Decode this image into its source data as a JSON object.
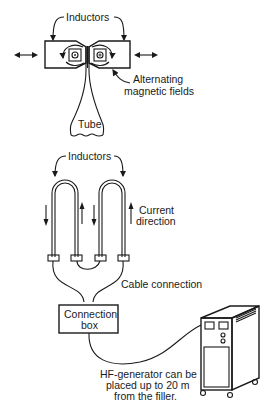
{
  "diagram": {
    "top": {
      "inductors_label": "Inductors",
      "magnetic_label_line1": "Alternating",
      "magnetic_label_line2": "magnetic fields",
      "tube_label": "Tube"
    },
    "bottom": {
      "inductors_label": "Inductors",
      "current_label_line1": "Current",
      "current_label_line2": "direction",
      "cable_label": "Cable connection",
      "box_label_line1": "Connection",
      "box_label_line2": "box",
      "generator_note_line1": "HF-generator can be",
      "generator_note_line2": "placed up to 20 m",
      "generator_note_line3": "from the filler."
    },
    "colors": {
      "ink": "#1a1a1a",
      "background": "#ffffff"
    }
  }
}
